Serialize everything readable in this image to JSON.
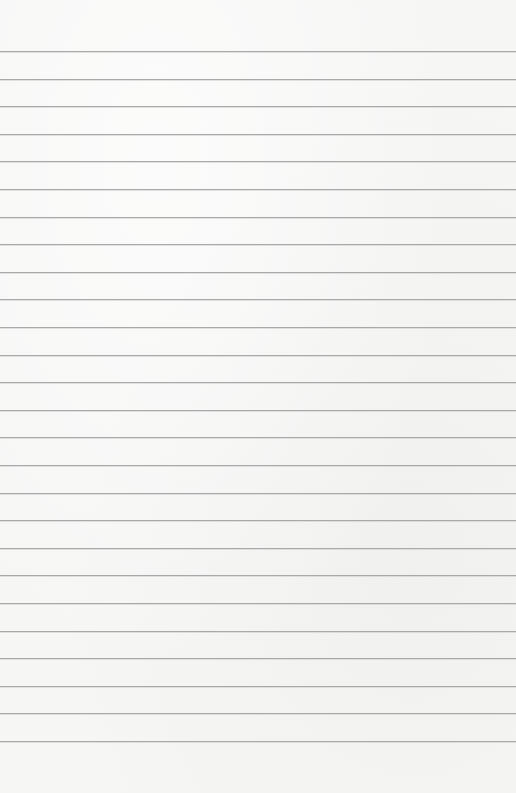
{
  "page": {
    "type": "lined-paper",
    "background_color": "#f6f6f5",
    "line_color": "#a9a9a9",
    "line_count": 26,
    "first_line_y": 51,
    "line_spacing": 27.6
  }
}
